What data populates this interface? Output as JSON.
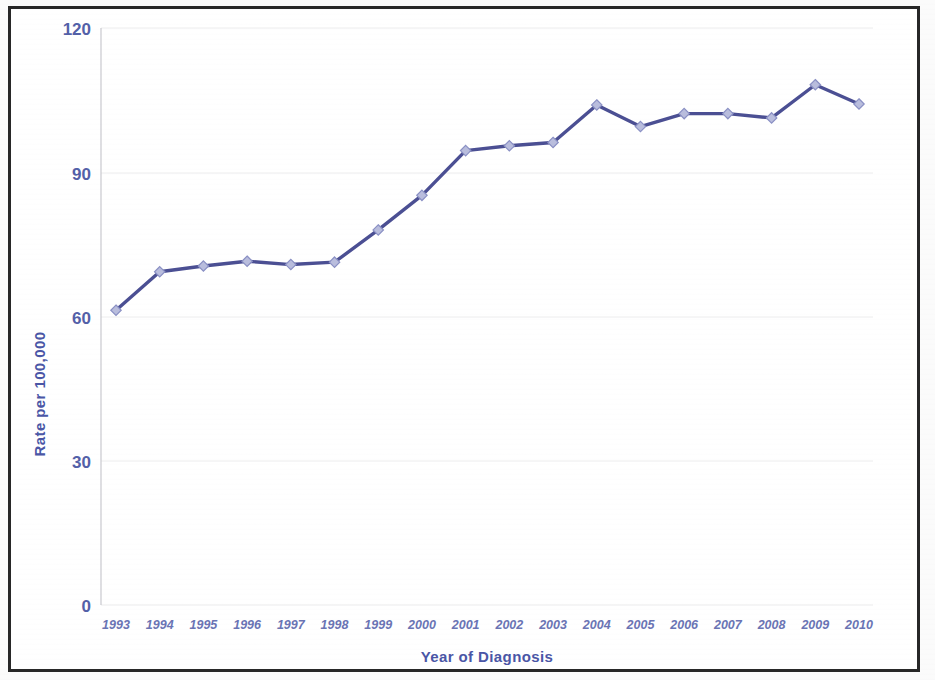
{
  "figure": {
    "frame_color": "#272727",
    "background_color": "#ffffff"
  },
  "chart_data": {
    "type": "line",
    "title": "",
    "xlabel": "Year of Diagnosis",
    "ylabel": "Rate per 100,000",
    "categories": [
      "1993",
      "1994",
      "1995",
      "1996",
      "1997",
      "1998",
      "1999",
      "2000",
      "2001",
      "2002",
      "2003",
      "2004",
      "2005",
      "2006",
      "2007",
      "2008",
      "2009",
      "2010"
    ],
    "values": [
      61.3,
      69.3,
      70.5,
      71.5,
      70.8,
      71.3,
      78.0,
      85.2,
      94.5,
      95.5,
      96.2,
      104.0,
      99.5,
      102.2,
      102.2,
      101.3,
      108.2,
      104.2
    ],
    "series": [
      {
        "name": "Rate per 100,000",
        "values": [
          61.3,
          69.3,
          70.5,
          71.5,
          70.8,
          71.3,
          78.0,
          85.2,
          94.5,
          95.5,
          96.2,
          104.0,
          99.5,
          102.2,
          102.2,
          101.3,
          108.2,
          104.2
        ]
      }
    ],
    "ylim": [
      0,
      120
    ],
    "yticks": [
      0,
      30,
      60,
      90,
      120
    ],
    "ytick_labels": [
      "0",
      "30",
      "60",
      "90",
      "120"
    ],
    "grid": true,
    "grid_axis": "y",
    "legend": "none",
    "line_color": "#4b4f93",
    "marker_color": "#b9bddd",
    "marker_shape": "diamond",
    "text_color": "#5360a8"
  }
}
